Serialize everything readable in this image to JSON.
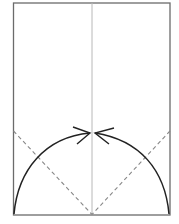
{
  "diagram": {
    "type": "origami-fold-instruction",
    "paper": {
      "x": 13,
      "y": 3,
      "width": 157,
      "height": 212,
      "stroke": "#6b6b6b"
    },
    "center_crease": {
      "x": 92,
      "y1": 3,
      "y2": 215,
      "stroke": "#b8b8b8"
    },
    "valley_folds": [
      {
        "x1": 13,
        "y1": 132,
        "x2": 92,
        "y2": 215
      },
      {
        "x1": 170,
        "y1": 132,
        "x2": 92,
        "y2": 215
      }
    ],
    "fold_arrows": [
      {
        "from": "bottom-left-corner",
        "to": "center"
      },
      {
        "from": "bottom-right-corner",
        "to": "center"
      }
    ],
    "colors": {
      "line": "#222222",
      "dash": "#888888",
      "crease": "#b8b8b8",
      "border": "#6b6b6b"
    }
  }
}
